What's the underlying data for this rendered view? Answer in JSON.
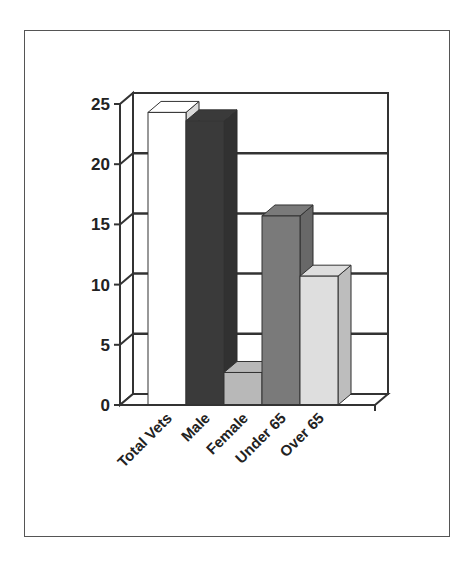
{
  "chart_data": {
    "type": "bar",
    "style": "3d-column",
    "title": "",
    "xlabel": "",
    "ylabel": "",
    "categories": [
      "Total Vets",
      "Male",
      "Female",
      "Under 65",
      "Over 65"
    ],
    "values": [
      24.3,
      23.6,
      2.7,
      15.7,
      10.7
    ],
    "ylim": [
      0,
      25
    ],
    "yticks": [
      0,
      5,
      10,
      15,
      20,
      25
    ],
    "ytick_labels": [
      "0",
      "5",
      "10",
      "15",
      "20",
      "25"
    ],
    "grid": true,
    "legend": null,
    "bar_colors": [
      "#ffffff",
      "#3a3a3a",
      "#b8b8b8",
      "#7a7a7a",
      "#dedede"
    ]
  }
}
